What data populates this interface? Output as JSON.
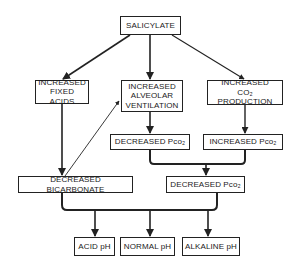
{
  "diagram": {
    "nodes": {
      "salicylate": "SALICYLATE",
      "fixed_acids": "INCREASED\nFIXED ACIDS",
      "alveolar_ventilation": "INCREASED\nALVEOLAR\nVENTILATION",
      "co2_production_line1": "INCREASED",
      "co2_production_line2": "CO₂ PRODUCTION",
      "decreased_pco2_top": "DECREASED Pco₂",
      "increased_pco2": "INCREASED Pco₂",
      "decreased_bicarbonate": "DECREASED BICARBONATE",
      "decreased_pco2_bottom": "DECREASED Pco₂",
      "acid_ph": "ACID pH",
      "normal_ph": "NORMAL pH",
      "alkaline_ph": "ALKALINE pH"
    },
    "edges": [
      {
        "from": "salicylate",
        "to": "fixed_acids"
      },
      {
        "from": "salicylate",
        "to": "alveolar_ventilation"
      },
      {
        "from": "salicylate",
        "to": "co2_production"
      },
      {
        "from": "fixed_acids",
        "to": "decreased_bicarbonate"
      },
      {
        "from": "decreased_bicarbonate",
        "to": "alveolar_ventilation"
      },
      {
        "from": "alveolar_ventilation",
        "to": "decreased_pco2_top"
      },
      {
        "from": "co2_production",
        "to": "increased_pco2"
      },
      {
        "from": [
          "decreased_pco2_top",
          "increased_pco2"
        ],
        "to": "decreased_pco2_bottom"
      },
      {
        "from": [
          "decreased_bicarbonate",
          "decreased_pco2_bottom"
        ],
        "to": [
          "acid_ph",
          "normal_ph",
          "alkaline_ph"
        ]
      }
    ],
    "colors": {
      "line": "#222222",
      "background": "#ffffff"
    }
  }
}
